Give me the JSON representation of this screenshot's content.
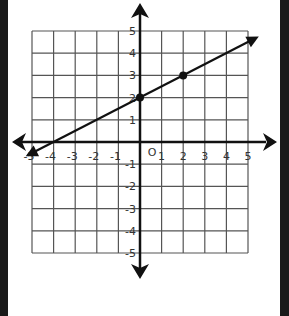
{
  "chart_data": {
    "type": "line",
    "title": "",
    "xlabel": "",
    "ylabel": "",
    "xlim": [
      -5,
      5
    ],
    "ylim": [
      -5,
      5
    ],
    "grid": true,
    "origin_label": "O",
    "x_ticks": [
      "-5",
      "-4",
      "-3",
      "-2",
      "-1",
      "1",
      "2",
      "3",
      "4",
      "5"
    ],
    "y_ticks": [
      "5",
      "4",
      "3",
      "2",
      "1",
      "-1",
      "-2",
      "-3",
      "-4",
      "-5"
    ],
    "series": [
      {
        "name": "line",
        "equation": "y = 0.5x + 2",
        "slope": 0.5,
        "intercept": 2,
        "points": [
          {
            "x": 0,
            "y": 2
          },
          {
            "x": 2,
            "y": 3
          }
        ],
        "extends": {
          "from_x": -5.2,
          "to_x": 5.5
        }
      }
    ]
  },
  "colors": {
    "frame": "#1a1a1a",
    "grid": "#555555",
    "axis": "#111111",
    "line": "#111111"
  }
}
